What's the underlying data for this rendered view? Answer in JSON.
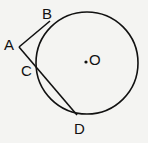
{
  "diagram": {
    "circle": {
      "cx": 87,
      "cy": 63,
      "r": 51,
      "stroke": "#111111"
    },
    "center": {
      "x": 86,
      "y": 62,
      "label": "O"
    },
    "points": {
      "A": {
        "x": 19,
        "y": 47,
        "label": "A"
      },
      "B": {
        "x": 50,
        "y": 21,
        "label": "B"
      },
      "C": {
        "x": 36,
        "y": 68,
        "label": "C"
      },
      "D": {
        "x": 77,
        "y": 115,
        "label": "D"
      }
    },
    "segments": [
      [
        "A",
        "B"
      ],
      [
        "A",
        "D"
      ]
    ]
  }
}
